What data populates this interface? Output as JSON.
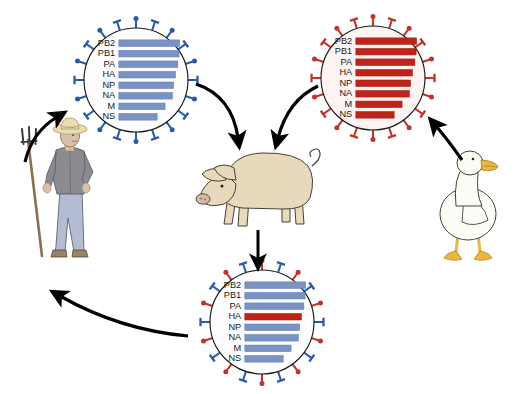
{
  "figure": {
    "background_color": "#ffffff"
  },
  "colors": {
    "blue_segment": "#7a93c4",
    "blue_segment_edge": "#5f7bb0",
    "blue_spike": "#2a5ca8",
    "red_segment": "#c0231a",
    "red_segment_edge": "#9c1c14",
    "red_spike": "#c0342a",
    "virus_outline": "#1a1a1a",
    "virus_fill_blue": "#fdfdfd",
    "virus_fill_red": "#fdf3f2",
    "arrow": "#000000",
    "pig_body": "#e8d9bd",
    "pig_outline": "#4a4035",
    "pig_snout": "#d8b7a8",
    "duck_body": "#fdfdf8",
    "duck_outline": "#4a4035",
    "duck_bill": "#e8b840",
    "farmer_hat": "#e8dcb0",
    "farmer_shirt": "#8a8a90",
    "farmer_jeans": "#b4bcd4",
    "farmer_skin": "#d8c0aa",
    "pitchfork": "#8a7050"
  },
  "segment_names": [
    "PB2",
    "PB1",
    "PA",
    "HA",
    "NP",
    "NA",
    "M",
    "NS"
  ],
  "viruses": [
    {
      "id": "human-virus",
      "name": "Human influenza virus",
      "host": "human",
      "spike_colors": [
        "blue"
      ],
      "segments": [
        {
          "label": "PB2",
          "color": "blue",
          "length": 1.0
        },
        {
          "label": "PB1",
          "color": "blue",
          "length": 0.99
        },
        {
          "label": "PA",
          "color": "blue",
          "length": 0.97
        },
        {
          "label": "HA",
          "color": "blue",
          "length": 0.93
        },
        {
          "label": "NP",
          "color": "blue",
          "length": 0.9
        },
        {
          "label": "NA",
          "color": "blue",
          "length": 0.88
        },
        {
          "label": "M",
          "color": "blue",
          "length": 0.76
        },
        {
          "label": "NS",
          "color": "blue",
          "length": 0.63
        }
      ]
    },
    {
      "id": "avian-virus",
      "name": "Avian influenza virus",
      "host": "duck",
      "spike_colors": [
        "red"
      ],
      "segments": [
        {
          "label": "PB2",
          "color": "red",
          "length": 1.0
        },
        {
          "label": "PB1",
          "color": "red",
          "length": 0.99
        },
        {
          "label": "PA",
          "color": "red",
          "length": 0.97
        },
        {
          "label": "HA",
          "color": "red",
          "length": 0.93
        },
        {
          "label": "NP",
          "color": "red",
          "length": 0.9
        },
        {
          "label": "NA",
          "color": "red",
          "length": 0.88
        },
        {
          "label": "M",
          "color": "red",
          "length": 0.76
        },
        {
          "label": "NS",
          "color": "red",
          "length": 0.63
        }
      ]
    },
    {
      "id": "reassortant-virus",
      "name": "Reassortant influenza virus",
      "host": "pig",
      "spike_colors": [
        "blue",
        "red"
      ],
      "segments": [
        {
          "label": "PB2",
          "color": "blue",
          "length": 1.0
        },
        {
          "label": "PB1",
          "color": "blue",
          "length": 0.99
        },
        {
          "label": "PA",
          "color": "blue",
          "length": 0.97
        },
        {
          "label": "HA",
          "color": "red",
          "length": 0.93
        },
        {
          "label": "NP",
          "color": "blue",
          "length": 0.9
        },
        {
          "label": "NA",
          "color": "blue",
          "length": 0.88
        },
        {
          "label": "M",
          "color": "blue",
          "length": 0.76
        },
        {
          "label": "NS",
          "color": "blue",
          "length": 0.63
        }
      ]
    }
  ],
  "animals": [
    {
      "id": "farmer",
      "name": "farmer",
      "props": [
        "pitchfork",
        "straw hat"
      ]
    },
    {
      "id": "pig",
      "name": "pig"
    },
    {
      "id": "duck",
      "name": "duck"
    }
  ],
  "arrows": [
    {
      "id": "arrow-human-to-pig",
      "from": "human-virus",
      "to": "pig"
    },
    {
      "id": "arrow-avian-to-pig",
      "from": "avian-virus",
      "to": "pig"
    },
    {
      "id": "arrow-pig-to-reassortant",
      "from": "pig",
      "to": "reassortant-virus"
    },
    {
      "id": "arrow-reassortant-to-farmer",
      "from": "reassortant-virus",
      "to": "farmer"
    },
    {
      "id": "arrow-farmer-to-human",
      "from": "farmer",
      "to": "human-virus"
    },
    {
      "id": "arrow-duck-to-avian",
      "from": "duck",
      "to": "avian-virus"
    }
  ]
}
